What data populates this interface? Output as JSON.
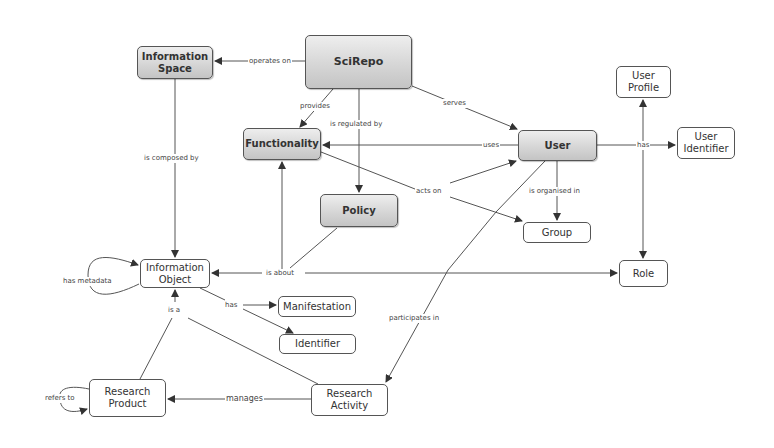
{
  "diagram": {
    "nodes": {
      "scirepo": "SciRepo",
      "information_space": "Information Space",
      "functionality": "Functionality",
      "policy": "Policy",
      "user": "User",
      "user_profile": "User Profile",
      "user_identifier": "User Identifier",
      "group": "Group",
      "role": "Role",
      "information_object": "Information Object",
      "manifestation": "Manifestation",
      "identifier": "Identifier",
      "research_product": "Research Product",
      "research_activity": "Research Activity"
    },
    "edges": {
      "operates_on": "operates on",
      "provides": "provides",
      "is_regulated_by": "is regulated by",
      "serves": "serves",
      "uses": "uses",
      "has_user": "has",
      "is_composed_by": "is composed by",
      "acts_on": "acts on",
      "is_organised_in": "is organised in",
      "is_about": "is about",
      "has_metadata": "has metadata",
      "has_io": "has",
      "is_a": "is a",
      "participates_in": "participates in",
      "refers_to": "refers to",
      "manages": "manages"
    }
  }
}
